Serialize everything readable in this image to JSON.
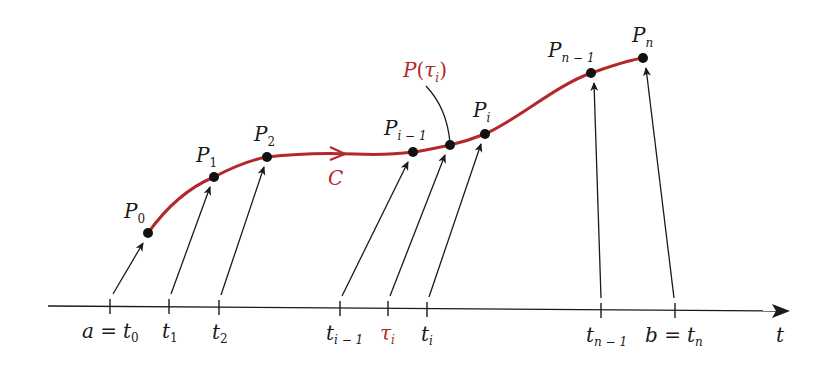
{
  "figure": {
    "curve_name": "C",
    "axis_variable": "t",
    "colors": {
      "curve": "#b3282d",
      "ink": "#1a1a1a",
      "background": "#ffffff"
    },
    "highlight_label": {
      "base": "P",
      "open": "(",
      "tau": "τ",
      "sub": "i",
      "close": ")"
    },
    "points": [
      {
        "id": "P0",
        "base": "P",
        "sub": "0",
        "x": 148,
        "y": 233
      },
      {
        "id": "P1",
        "base": "P",
        "sub": "1",
        "x": 214,
        "y": 177
      },
      {
        "id": "P2",
        "base": "P",
        "sub": "2",
        "x": 267,
        "y": 157
      },
      {
        "id": "Pi-1",
        "base": "P",
        "sub": "i − 1",
        "x": 413,
        "y": 152
      },
      {
        "id": "Ptau",
        "base": "P(τi)",
        "sub": "",
        "x": 450,
        "y": 145
      },
      {
        "id": "Pi",
        "base": "P",
        "sub": "i",
        "x": 485,
        "y": 134
      },
      {
        "id": "Pn-1",
        "base": "P",
        "sub": "n − 1",
        "x": 591,
        "y": 73
      },
      {
        "id": "Pn",
        "base": "P",
        "sub": "n",
        "x": 643,
        "y": 58
      }
    ],
    "ticks": [
      {
        "id": "t0",
        "x": 110,
        "label_pre": "a = ",
        "base": "t",
        "sub": "0"
      },
      {
        "id": "t1",
        "x": 169,
        "label_pre": "",
        "base": "t",
        "sub": "1"
      },
      {
        "id": "t2",
        "x": 219,
        "label_pre": "",
        "base": "t",
        "sub": "2"
      },
      {
        "id": "ti-1",
        "x": 340,
        "label_pre": "",
        "base": "t",
        "sub": "i − 1"
      },
      {
        "id": "tau_i",
        "x": 388,
        "label_pre": "",
        "base": "τ",
        "sub": "i"
      },
      {
        "id": "ti",
        "x": 427,
        "label_pre": "",
        "base": "t",
        "sub": "i"
      },
      {
        "id": "tn-1",
        "x": 601,
        "label_pre": "",
        "base": "t",
        "sub": "n − 1"
      },
      {
        "id": "tn",
        "x": 675,
        "label_pre": "b = ",
        "base": "t",
        "sub": "n"
      }
    ],
    "labels": {
      "a_eq": "a =",
      "b_eq": "b =",
      "t0": "t",
      "t0_sub": "0",
      "t1": "t",
      "t1_sub": "1",
      "t2": "t",
      "t2_sub": "2",
      "ti1": "t",
      "ti1_sub": "i − 1",
      "tau": "τ",
      "tau_sub": "i",
      "ti": "t",
      "ti_sub": "i",
      "tn1": "t",
      "tn1_sub": "n − 1",
      "tn": "t",
      "tn_sub": "n",
      "axis_t": "t",
      "P": "P",
      "P0_sub": "0",
      "P1_sub": "1",
      "P2_sub": "2",
      "Pi1_sub": "i − 1",
      "Pi_sub": "i",
      "Pn1_sub": "n − 1",
      "Pn_sub": "n",
      "C": "C"
    }
  }
}
